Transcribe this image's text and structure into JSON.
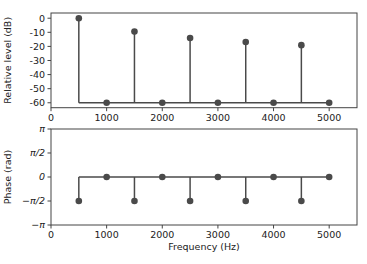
{
  "chart_data": [
    {
      "type": "stem",
      "title": "",
      "xlabel": "",
      "ylabel": "Relative level (dB)",
      "xlim": [
        0,
        5500
      ],
      "ylim": [
        -63.5,
        3.7
      ],
      "xticks": [
        0,
        1000,
        2000,
        3000,
        4000,
        5000
      ],
      "xtick_labels": [
        "0",
        "1000",
        "2000",
        "3000",
        "4000",
        "5000"
      ],
      "yticks": [
        0,
        -10,
        -20,
        -30,
        -40,
        -50,
        -60
      ],
      "ytick_labels": [
        "0",
        "-10",
        "-20",
        "-30",
        "-40",
        "-50",
        "-60"
      ],
      "baseline": -60,
      "grid": false,
      "x": [
        500,
        1000,
        1500,
        2000,
        2500,
        3000,
        3500,
        4000,
        4500,
        5000
      ],
      "values": [
        0,
        -60,
        -9.5,
        -60,
        -14.0,
        -60,
        -16.9,
        -60,
        -19.1,
        -60
      ]
    },
    {
      "type": "stem",
      "title": "",
      "xlabel": "Frequency (Hz)",
      "ylabel": "Phase (rad)",
      "xlim": [
        0,
        5500
      ],
      "ylim": [
        -3.14159,
        3.14159
      ],
      "xticks": [
        0,
        1000,
        2000,
        3000,
        4000,
        5000
      ],
      "xtick_labels": [
        "0",
        "1000",
        "2000",
        "3000",
        "4000",
        "5000"
      ],
      "yticks": [
        3.14159,
        1.5708,
        0,
        -1.5708,
        -3.14159
      ],
      "ytick_labels": [
        "π",
        "π/2",
        "0",
        "−π/2",
        "−π"
      ],
      "baseline": 0,
      "grid": false,
      "x": [
        500,
        1000,
        1500,
        2000,
        2500,
        3000,
        3500,
        4000,
        4500,
        5000
      ],
      "values": [
        -1.5708,
        0,
        -1.5708,
        0,
        -1.5708,
        0,
        -1.5708,
        0,
        -1.5708,
        0
      ]
    }
  ],
  "style": {
    "stem_color": "#4a4a4a",
    "marker_color": "#4a4a4a",
    "axes_color": "#444444"
  }
}
